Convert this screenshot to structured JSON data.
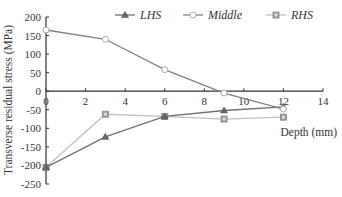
{
  "chart_data": {
    "type": "line",
    "title": "",
    "xlabel": "Depth (mm)",
    "ylabel": "Transverse residual stress (MPa)",
    "xlim": [
      0,
      14
    ],
    "ylim": [
      -250,
      200
    ],
    "xticks": [
      0,
      2,
      4,
      6,
      8,
      10,
      12,
      14
    ],
    "yticks": [
      200,
      150,
      100,
      50,
      0,
      -50,
      -100,
      -150,
      -200,
      -250
    ],
    "grid": false,
    "legend_position": "top",
    "x": [
      0,
      3,
      6,
      9,
      12
    ],
    "series": [
      {
        "name": "LHS",
        "marker": "triangle",
        "color": "#707070",
        "values": [
          -205,
          -123,
          -68,
          -52,
          -42
        ]
      },
      {
        "name": "Middle",
        "marker": "circle",
        "color": "#808080",
        "values": [
          165,
          140,
          58,
          -5,
          -48
        ]
      },
      {
        "name": "RHS",
        "marker": "square",
        "color": "#c0c0c0",
        "values": [
          -205,
          -62,
          -68,
          -75,
          -70
        ]
      }
    ]
  }
}
